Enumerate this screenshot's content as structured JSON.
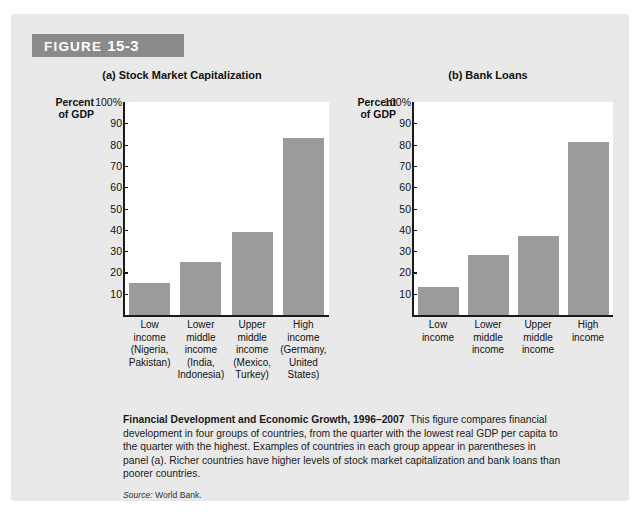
{
  "figure": {
    "banner_prefix": "FIGURE",
    "banner_number": "15-3"
  },
  "caption": {
    "title": "Financial Development and Economic Growth, 1996–2007",
    "body": "This figure compares financial development in four groups of countries, from the quarter with the lowest real GDP per capita to the quarter with the highest. Examples of countries in each group appear in parentheses in panel (a). Richer countries have higher levels of stock market capitalization and bank loans than poorer countries.",
    "source_word": "Source:",
    "source_value": "World Bank."
  },
  "axis_caption": {
    "line1": "Percent",
    "line2": "of GDP"
  },
  "chart_data": [
    {
      "type": "bar",
      "title": "(a) Stock Market Capitalization",
      "xlabel": "",
      "ylabel": "Percent of GDP",
      "ylim": [
        0,
        100
      ],
      "ytick_values": [
        100,
        90,
        80,
        70,
        60,
        50,
        40,
        30,
        20,
        10
      ],
      "ytick_labels": [
        "100%",
        "90",
        "80",
        "70",
        "60",
        "50",
        "40",
        "30",
        "20",
        "10"
      ],
      "grid": false,
      "legend": "none",
      "bar_color": "#9b9b9b",
      "categories": [
        "Low\nincome\n(Nigeria,\nPakistan)",
        "Lower\nmiddle\nincome\n(India,\nIndonesia)",
        "Upper\nmiddle\nincome\n(Mexico,\nTurkey)",
        "High\nincome\n(Germany,\nUnited\nStates)"
      ],
      "category_lines": [
        [
          "Low",
          "income",
          "(Nigeria,",
          "Pakistan)"
        ],
        [
          "Lower",
          "middle",
          "income",
          "(India,",
          "Indonesia)"
        ],
        [
          "Upper",
          "middle",
          "income",
          "(Mexico,",
          "Turkey)"
        ],
        [
          "High",
          "income",
          "(Germany,",
          "United",
          "States)"
        ]
      ],
      "values": [
        15,
        25,
        39,
        83
      ]
    },
    {
      "type": "bar",
      "title": "(b) Bank Loans",
      "xlabel": "",
      "ylabel": "Percent of GDP",
      "ylim": [
        0,
        100
      ],
      "ytick_values": [
        100,
        90,
        80,
        70,
        60,
        50,
        40,
        30,
        20,
        10
      ],
      "ytick_labels": [
        "100%",
        "90",
        "80",
        "70",
        "60",
        "50",
        "40",
        "30",
        "20",
        "10"
      ],
      "grid": false,
      "legend": "none",
      "bar_color": "#9b9b9b",
      "categories": [
        "Low\nincome",
        "Lower\nmiddle\nincome",
        "Upper\nmiddle\nincome",
        "High\nincome"
      ],
      "category_lines": [
        [
          "Low",
          "income"
        ],
        [
          "Lower",
          "middle",
          "income"
        ],
        [
          "Upper",
          "middle",
          "income"
        ],
        [
          "High",
          "income"
        ]
      ],
      "values": [
        13,
        28,
        37,
        81
      ]
    }
  ]
}
